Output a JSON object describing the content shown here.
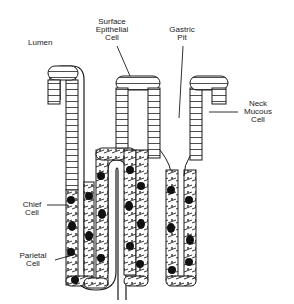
{
  "diagram": {
    "labels": {
      "lumen": "Lumen",
      "surface_epithelial_cell": "Surface\nEpithelial\nCell",
      "gastric_pit": "Gastric\nPit",
      "neck_mucous_cell": "Neck\nMucous\nCell",
      "chief_cell": "Chief\nCell",
      "parietal_cell": "Parietal\nCell"
    },
    "colors": {
      "line": "#1a1a1a",
      "parietal_fill": "#111111",
      "background": "#ffffff"
    }
  }
}
